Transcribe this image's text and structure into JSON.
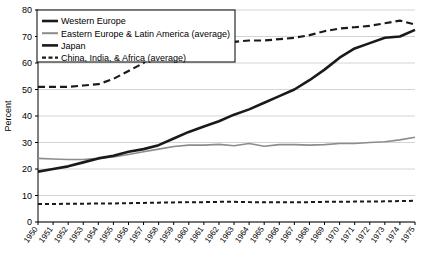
{
  "chart_data": {
    "type": "line",
    "title": "",
    "xlabel": "",
    "ylabel": "Percent",
    "ylim": [
      0,
      80
    ],
    "ytick_step": 10,
    "yticks": [
      0,
      10,
      20,
      30,
      40,
      50,
      60,
      70,
      80
    ],
    "grid": true,
    "legend_position": "top-left",
    "categories": [
      "1950",
      "1951",
      "1952",
      "1953",
      "1954",
      "1955",
      "1956",
      "1957",
      "1958",
      "1959",
      "1960",
      "1961",
      "1962",
      "1963",
      "1964",
      "1965",
      "1966",
      "1967",
      "1968",
      "1969",
      "1970",
      "1971",
      "1972",
      "1973",
      "1974",
      "1975"
    ],
    "series": [
      {
        "name": "Western Europe",
        "style": "long-dash",
        "color": "#1a1a1a",
        "width": 2.2,
        "values": [
          51,
          51,
          51,
          51.5,
          52,
          54,
          57,
          60,
          67.5,
          68,
          68,
          68,
          68,
          68,
          68.5,
          68.5,
          69,
          69.5,
          70.5,
          72,
          73,
          73.5,
          74,
          75,
          76,
          74.5
        ]
      },
      {
        "name": "Eastern Europe & Latin America (average)",
        "style": "solid",
        "color": "#8c8c8c",
        "width": 1.6,
        "values": [
          24,
          23.8,
          23.6,
          23.6,
          24,
          24.5,
          25.5,
          26.5,
          27.5,
          28.5,
          29,
          29,
          29.3,
          28.8,
          29.6,
          28.6,
          29.2,
          29.2,
          29,
          29.2,
          29.6,
          29.6,
          30,
          30.3,
          31,
          32
        ]
      },
      {
        "name": "Japan",
        "style": "solid",
        "color": "#1a1a1a",
        "width": 2.6,
        "values": [
          19,
          20,
          21,
          22.5,
          24,
          25,
          26.5,
          27.5,
          29,
          31.5,
          34,
          36,
          38,
          40.5,
          42.5,
          45,
          47.5,
          50,
          53.5,
          57.5,
          62,
          65.5,
          67.5,
          69.5,
          70,
          72.5
        ]
      },
      {
        "name": "China, India, & Africa (average)",
        "style": "short-dash",
        "color": "#1a1a1a",
        "width": 2.0,
        "values": [
          6.8,
          6.8,
          6.9,
          6.9,
          7.0,
          7.0,
          7.1,
          7.2,
          7.3,
          7.4,
          7.5,
          7.5,
          7.6,
          7.6,
          7.5,
          7.5,
          7.5,
          7.5,
          7.5,
          7.6,
          7.6,
          7.7,
          7.7,
          7.8,
          7.9,
          8.0
        ]
      }
    ]
  },
  "legend": {
    "items": [
      {
        "label": "Western Europe",
        "swatch": "thick-solid"
      },
      {
        "label": "Eastern Europe & Latin America (average)",
        "swatch": "gray-solid"
      },
      {
        "label": "Japan",
        "swatch": "thick-solid"
      },
      {
        "label": "China, India, & Africa (average)",
        "swatch": "dashed"
      }
    ]
  },
  "colors": {
    "axis": "#000000",
    "grid": "#c8c8c8",
    "dark_series": "#1a1a1a",
    "gray_series": "#8c8c8c",
    "background": "#ffffff"
  }
}
